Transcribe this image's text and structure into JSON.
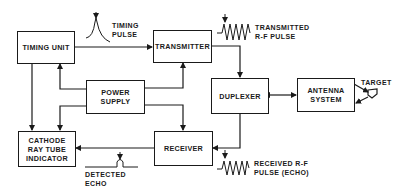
{
  "diagram": {
    "blocks": {
      "timing_unit": "TIMING UNIT",
      "transmitter": "TRANSMITTER",
      "power_supply": "POWER\nSUPPLY",
      "duplexer": "DUPLEXER",
      "antenna_system": "ANTENNA\nSYSTEM",
      "crt_indicator": "CATHODE\nRAY TUBE\nINDICATOR",
      "receiver": "RECEIVER"
    },
    "annotations": {
      "timing_pulse": "TIMING\nPULSE",
      "transmitted_pulse": "TRANSMITTED\nR-F PULSE",
      "target": "TARGET",
      "detected_echo": "DETECTED\nECHO",
      "received_pulse": "RECEIVED R-F\nPULSE (ECHO)"
    },
    "colors": {
      "line": "#1a1a1a",
      "background": "#ffffff"
    }
  }
}
